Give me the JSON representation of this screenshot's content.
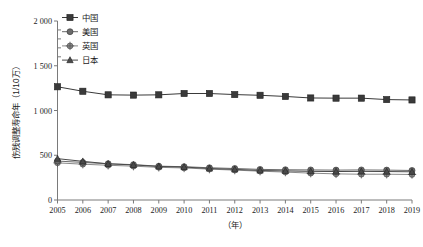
{
  "chart_data": {
    "type": "line",
    "title": "",
    "xlabel": "（年）",
    "ylabel": "伤残调整寿命年（1/10万）",
    "x": [
      2005,
      2006,
      2007,
      2008,
      2009,
      2010,
      2011,
      2012,
      2013,
      2014,
      2015,
      2016,
      2017,
      2018,
      2019
    ],
    "categories": [
      "2005",
      "2006",
      "2007",
      "2008",
      "2009",
      "2010",
      "2011",
      "2012",
      "2013",
      "2014",
      "2015",
      "2016",
      "2017",
      "2018",
      "2019"
    ],
    "xlim": [
      2005,
      2019
    ],
    "ylim": [
      0,
      2000
    ],
    "yticks": [
      0,
      500,
      1000,
      1500,
      2000
    ],
    "ytick_labels": [
      "0",
      "500",
      "1 000",
      "1 500",
      "2 000"
    ],
    "grid": false,
    "legend_position": "top-left",
    "series": [
      {
        "name": "中国",
        "marker": "square",
        "color": "#3a3a3a",
        "values": [
          1265,
          1215,
          1175,
          1172,
          1175,
          1190,
          1190,
          1178,
          1170,
          1157,
          1140,
          1138,
          1138,
          1122,
          1118
        ]
      },
      {
        "name": "美国",
        "marker": "circle",
        "color": "#6b6b6b",
        "values": [
          435,
          420,
          405,
          395,
          378,
          372,
          360,
          352,
          342,
          338,
          336,
          334,
          336,
          334,
          330
        ]
      },
      {
        "name": "英国",
        "marker": "plus-circle",
        "color": "#8a8a8a",
        "values": [
          415,
          400,
          388,
          378,
          365,
          358,
          345,
          334,
          322,
          312,
          300,
          292,
          288,
          288,
          285
        ]
      },
      {
        "name": "日本",
        "marker": "triangle",
        "color": "#4a4a4a",
        "values": [
          462,
          432,
          404,
          392,
          375,
          368,
          352,
          342,
          330,
          325,
          320,
          318,
          320,
          318,
          315
        ]
      }
    ]
  },
  "legend": {
    "items": [
      {
        "label": "中国"
      },
      {
        "label": "美国"
      },
      {
        "label": "英国"
      },
      {
        "label": "日本"
      }
    ]
  },
  "colors": {
    "axis": "#7a7a7a",
    "text": "#1c1c1c",
    "background": "#ffffff"
  }
}
